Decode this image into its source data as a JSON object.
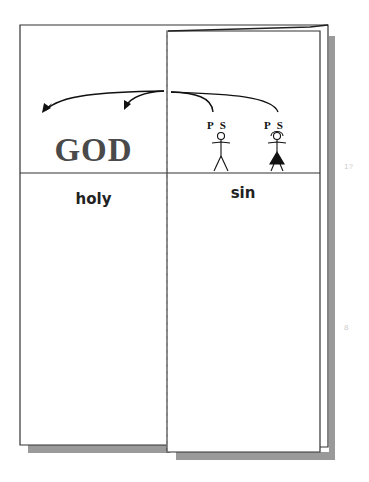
{
  "left_panel": {
    "title": "GOD",
    "label": "holy"
  },
  "right_panel": {
    "label": "sin",
    "figures": [
      {
        "name": "male-figure",
        "label": "P S"
      },
      {
        "name": "female-figure",
        "label": "P S"
      }
    ]
  },
  "margin_marks": [
    "1?",
    "8"
  ],
  "colors": {
    "line": "#222222",
    "shadow": "#9a9a9a",
    "title": "#4a4a4a",
    "dashed_fold": "#999999"
  }
}
